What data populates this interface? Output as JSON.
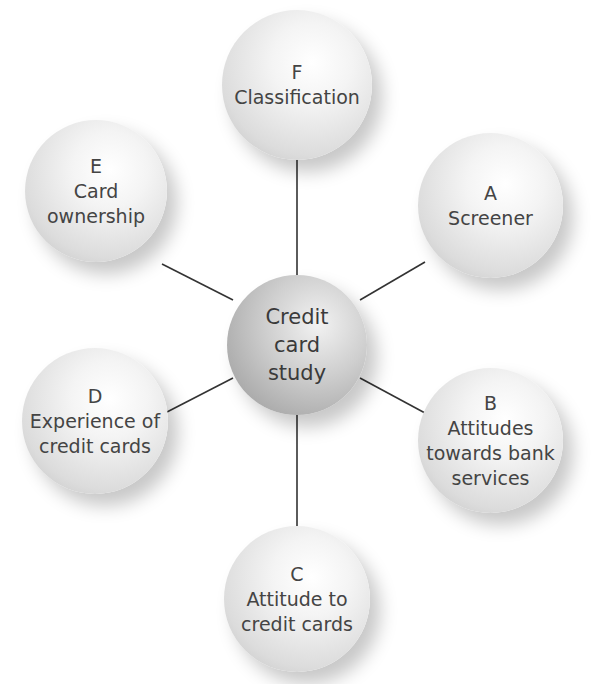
{
  "diagram": {
    "type": "hub-and-spoke",
    "center": {
      "lines": [
        "Credit",
        "card",
        "study"
      ]
    },
    "nodes": [
      {
        "id": "F",
        "letter": "F",
        "lines": [
          "Classification"
        ]
      },
      {
        "id": "A",
        "letter": "A",
        "lines": [
          "Screener"
        ]
      },
      {
        "id": "B",
        "letter": "B",
        "lines": [
          "Attitudes",
          "towards bank",
          "services"
        ]
      },
      {
        "id": "C",
        "letter": "C",
        "lines": [
          "Attitude to",
          "credit cards"
        ]
      },
      {
        "id": "D",
        "letter": "D",
        "lines": [
          "Experience of",
          "credit cards"
        ]
      },
      {
        "id": "E",
        "letter": "E",
        "lines": [
          "Card",
          "ownership"
        ]
      }
    ],
    "colors": {
      "connector": "#333333",
      "text": "#444444",
      "background": "#ffffff"
    }
  }
}
